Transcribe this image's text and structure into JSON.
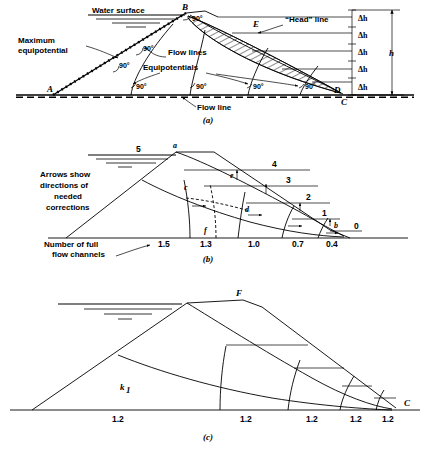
{
  "figure": {
    "panels": [
      {
        "id": "a",
        "caption": "(a)",
        "labels": {
          "water_surface": "Water surface",
          "maximum_equipotential": "Maximum\nequipotential",
          "maximum_equipotential_l1": "Maximum",
          "maximum_equipotential_l2": "equipotential",
          "flow_lines": "Flow lines",
          "equipotentials": "Equipotentials",
          "flow_line": "Flow line",
          "head_line": "“Head” line",
          "point_a": "A",
          "point_b": "B",
          "point_c": "C",
          "point_d": "D",
          "point_e": "E",
          "total_head": "h"
        },
        "angles": [
          "90°",
          "90°",
          "90°",
          "90°",
          "90°",
          "90°",
          "90°"
        ],
        "head_increments": [
          "Δh",
          "Δh",
          "Δh",
          "Δh",
          "Δh"
        ],
        "head_increment_count": 5
      },
      {
        "id": "b",
        "caption": "(b)",
        "labels": {
          "arrows_note_l1": "Arrows show",
          "arrows_note_l2": "directions of",
          "arrows_note_l3": "needed",
          "arrows_note_l4": "corrections",
          "channels_note_l1": "Number of full",
          "channels_note_l2": "flow channels",
          "point_a": "a",
          "point_b": "b",
          "point_c": "c",
          "point_d": "d",
          "point_e": "e",
          "point_f": "f"
        },
        "equipotential_numbers": [
          "5",
          "4",
          "3",
          "2",
          "1",
          "0"
        ],
        "flow_channel_values": [
          "1.5",
          "1.3",
          "1.0",
          "0.7",
          "0.4"
        ]
      },
      {
        "id": "c",
        "caption": "(c)",
        "labels": {
          "point_f": "F",
          "point_c": "C",
          "permeability": "k",
          "permeability_sub": "1"
        },
        "flow_channel_values": [
          "1.2",
          "1.2",
          "1.2",
          "1.2",
          "1.2"
        ]
      }
    ],
    "colors": {
      "ink": "#000000",
      "background": "#ffffff"
    }
  }
}
